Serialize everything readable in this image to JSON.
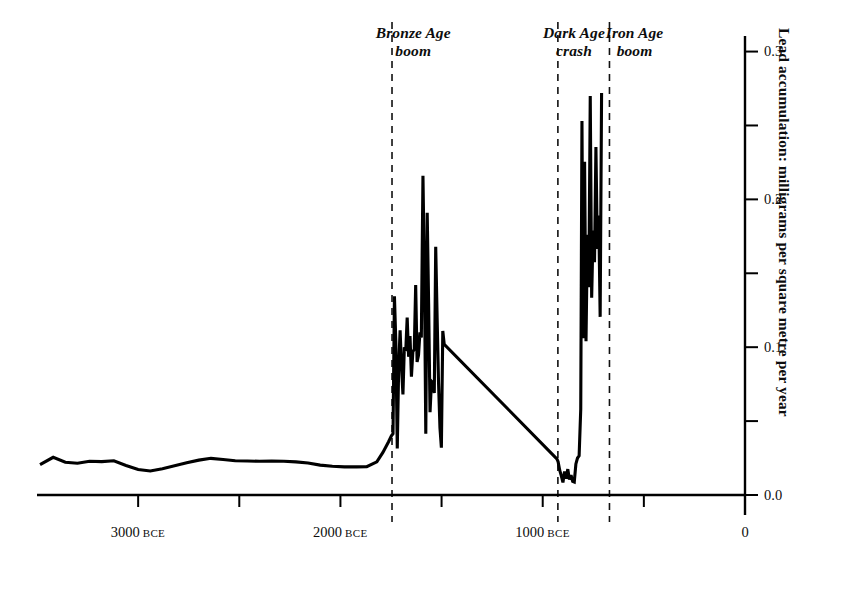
{
  "chart_data": {
    "type": "line",
    "title": "",
    "subtitle": "",
    "xlabel": "",
    "ylabel": "Lead accumulation: milligrams per square metre per year",
    "xlim": [
      -3500,
      0
    ],
    "ylim": [
      0.0,
      0.32
    ],
    "grid": false,
    "legend": "none",
    "x_unit": "years BCE",
    "x_ticks": [
      {
        "value": -3000,
        "label": "3000",
        "suffix": "BCE",
        "major": true
      },
      {
        "value": -2500,
        "label": "",
        "suffix": "",
        "major": false
      },
      {
        "value": -2000,
        "label": "2000",
        "suffix": "BCE",
        "major": true
      },
      {
        "value": -1500,
        "label": "",
        "suffix": "",
        "major": false
      },
      {
        "value": -1000,
        "label": "1000",
        "suffix": "BCE",
        "major": true
      },
      {
        "value": -500,
        "label": "",
        "suffix": "",
        "major": false
      },
      {
        "value": 0,
        "label": "0",
        "suffix": "",
        "major": true
      }
    ],
    "y_ticks": [
      {
        "value": 0.0,
        "label": "0.0",
        "major": true
      },
      {
        "value": 0.05,
        "label": "",
        "major": false
      },
      {
        "value": 0.1,
        "label": "0.1",
        "major": true
      },
      {
        "value": 0.15,
        "label": "",
        "major": false
      },
      {
        "value": 0.2,
        "label": "0.2",
        "major": true
      },
      {
        "value": 0.25,
        "label": "",
        "major": false
      },
      {
        "value": 0.3,
        "label": "0.3",
        "major": true
      }
    ],
    "annotations": [
      {
        "id": "bronze-age-boom",
        "text": "Bronze Age\nboom",
        "x_center": -1640,
        "y_top": 24
      },
      {
        "id": "dark-age-crash",
        "text": "Dark Age\ncrash",
        "x_center": -845,
        "y_top": 24
      },
      {
        "id": "iron-age-boom",
        "text": "Iron Age\nboom",
        "x_center": -545,
        "y_top": 24
      }
    ],
    "vertical_dividers": [
      {
        "id": "bronze-age-start",
        "x": -1745
      },
      {
        "id": "dark-age-start",
        "x": -925
      },
      {
        "id": "iron-age-start",
        "x": -670
      }
    ],
    "series": [
      {
        "name": "Lead accumulation",
        "color": "#000000",
        "line_width": 3.1,
        "points": [
          [
            -3485,
            0.0205
          ],
          [
            -3420,
            0.0255
          ],
          [
            -3360,
            0.0222
          ],
          [
            -3300,
            0.0215
          ],
          [
            -3240,
            0.0228
          ],
          [
            -3180,
            0.0226
          ],
          [
            -3120,
            0.0232
          ],
          [
            -3060,
            0.02
          ],
          [
            -3000,
            0.0172
          ],
          [
            -2940,
            0.0162
          ],
          [
            -2880,
            0.0178
          ],
          [
            -2820,
            0.0198
          ],
          [
            -2760,
            0.0218
          ],
          [
            -2700,
            0.0236
          ],
          [
            -2640,
            0.0248
          ],
          [
            -2580,
            0.024
          ],
          [
            -2520,
            0.0232
          ],
          [
            -2460,
            0.023
          ],
          [
            -2400,
            0.0228
          ],
          [
            -2340,
            0.023
          ],
          [
            -2280,
            0.0228
          ],
          [
            -2220,
            0.0224
          ],
          [
            -2160,
            0.0216
          ],
          [
            -2100,
            0.0202
          ],
          [
            -2040,
            0.0194
          ],
          [
            -1980,
            0.019
          ],
          [
            -1920,
            0.019
          ],
          [
            -1870,
            0.0192
          ],
          [
            -1820,
            0.0224
          ],
          [
            -1790,
            0.0288
          ],
          [
            -1762,
            0.036
          ],
          [
            -1748,
            0.04
          ],
          [
            -1740,
            0.0415
          ],
          [
            -1733,
            0.1345
          ],
          [
            -1726,
            0.103
          ],
          [
            -1719,
            0.0315
          ],
          [
            -1712,
            0.087
          ],
          [
            -1705,
            0.1115
          ],
          [
            -1698,
            0.087
          ],
          [
            -1691,
            0.068
          ],
          [
            -1684,
            0.1
          ],
          [
            -1677,
            0.0975
          ],
          [
            -1670,
            0.12
          ],
          [
            -1663,
            0.0935
          ],
          [
            -1656,
            0.1075
          ],
          [
            -1649,
            0.08
          ],
          [
            -1642,
            0.097
          ],
          [
            -1635,
            0.0985
          ],
          [
            -1628,
            0.142
          ],
          [
            -1621,
            0.09
          ],
          [
            -1614,
            0.0945
          ],
          [
            -1607,
            0.11
          ],
          [
            -1600,
            0.1065
          ],
          [
            -1592,
            0.216
          ],
          [
            -1585,
            0.15
          ],
          [
            -1578,
            0.0415
          ],
          [
            -1571,
            0.191
          ],
          [
            -1564,
            0.1295
          ],
          [
            -1557,
            0.056
          ],
          [
            -1550,
            0.077
          ],
          [
            -1543,
            0.076
          ],
          [
            -1536,
            0.069
          ],
          [
            -1529,
            0.168
          ],
          [
            -1522,
            0.12
          ],
          [
            -1515,
            0.076
          ],
          [
            -1508,
            0.0455
          ],
          [
            -1501,
            0.032
          ],
          [
            -1494,
            0.111
          ],
          [
            -1487,
            0.102
          ],
          [
            -930,
            0.0245
          ],
          [
            -924,
            0.0225
          ],
          [
            -916,
            0.0168
          ],
          [
            -908,
            0.013
          ],
          [
            -900,
            0.0085
          ],
          [
            -892,
            0.016
          ],
          [
            -884,
            0.011
          ],
          [
            -876,
            0.0175
          ],
          [
            -868,
            0.0105
          ],
          [
            -860,
            0.0135
          ],
          [
            -852,
            0.0092
          ],
          [
            -844,
            0.0088
          ],
          [
            -836,
            0.021
          ],
          [
            -828,
            0.025
          ],
          [
            -820,
            0.0265
          ],
          [
            -812,
            0.058
          ],
          [
            -806,
            0.253
          ],
          [
            -800,
            0.106
          ],
          [
            -793,
            0.2255
          ],
          [
            -786,
            0.104
          ],
          [
            -779,
            0.176
          ],
          [
            -772,
            0.1405
          ],
          [
            -765,
            0.27
          ],
          [
            -758,
            0.1335
          ],
          [
            -751,
            0.179
          ],
          [
            -744,
            0.1575
          ],
          [
            -737,
            0.2355
          ],
          [
            -730,
            0.1665
          ],
          [
            -723,
            0.189
          ],
          [
            -716,
            0.1205
          ],
          [
            -709,
            0.272
          ]
        ]
      }
    ],
    "curve_note": "Lead accumulation record; flat low background before ~1750 BCE, volatile high values through the Bronze Age, a collapse to near-zero in the Dark Age, then renewed high volatile values in the Iron Age."
  },
  "axis": {
    "y_axis_side": "right",
    "x_axis_side": "bottom",
    "axis_color": "#000000"
  }
}
